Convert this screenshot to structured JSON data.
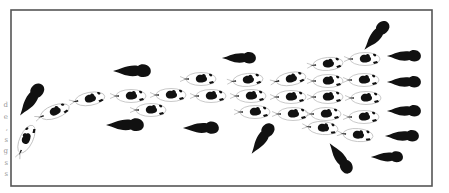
{
  "figure": {
    "frame": {
      "x": 11,
      "y": 10,
      "width": 421,
      "height": 176,
      "stroke": "#555555"
    },
    "colors": {
      "predator": "#111111",
      "school_outline": "#bbbbbb",
      "school_spot": "#111111",
      "background": "#ffffff"
    },
    "margin_text_fragments": [
      "d",
      "e",
      ",",
      "s",
      "g",
      "s",
      "s"
    ],
    "predators": [
      {
        "x": 31,
        "y": 100,
        "angle": -55,
        "scale": 1.0
      },
      {
        "x": 132,
        "y": 71,
        "angle": 0,
        "scale": 1.0
      },
      {
        "x": 125,
        "y": 125,
        "angle": 0,
        "scale": 1.0
      },
      {
        "x": 201,
        "y": 128,
        "angle": 0,
        "scale": 0.95
      },
      {
        "x": 239,
        "y": 58,
        "angle": 0,
        "scale": 0.9
      },
      {
        "x": 376,
        "y": 36,
        "angle": -50,
        "scale": 0.95
      },
      {
        "x": 404,
        "y": 56,
        "angle": 0,
        "scale": 0.9
      },
      {
        "x": 404,
        "y": 82,
        "angle": 0,
        "scale": 0.9
      },
      {
        "x": 404,
        "y": 111,
        "angle": 0,
        "scale": 0.9
      },
      {
        "x": 402,
        "y": 136,
        "angle": 0,
        "scale": 0.9
      },
      {
        "x": 387,
        "y": 157,
        "angle": 0,
        "scale": 0.85
      },
      {
        "x": 262,
        "y": 139,
        "angle": -55,
        "scale": 0.95
      },
      {
        "x": 340,
        "y": 158,
        "angle": 55,
        "scale": 0.95
      }
    ],
    "school": [
      {
        "x": 26,
        "y": 140,
        "angle": -65
      },
      {
        "x": 54,
        "y": 112,
        "angle": -20
      },
      {
        "x": 89,
        "y": 99,
        "angle": -10
      },
      {
        "x": 130,
        "y": 96,
        "angle": 0
      },
      {
        "x": 170,
        "y": 95,
        "angle": 0
      },
      {
        "x": 150,
        "y": 110,
        "angle": 0
      },
      {
        "x": 200,
        "y": 79,
        "angle": 0
      },
      {
        "x": 210,
        "y": 96,
        "angle": 0
      },
      {
        "x": 247,
        "y": 80,
        "angle": -5
      },
      {
        "x": 250,
        "y": 96,
        "angle": 0
      },
      {
        "x": 254,
        "y": 112,
        "angle": 0
      },
      {
        "x": 290,
        "y": 79,
        "angle": -10
      },
      {
        "x": 290,
        "y": 97,
        "angle": 0
      },
      {
        "x": 292,
        "y": 114,
        "angle": 0
      },
      {
        "x": 327,
        "y": 64,
        "angle": -5
      },
      {
        "x": 327,
        "y": 81,
        "angle": 0
      },
      {
        "x": 327,
        "y": 97,
        "angle": 0
      },
      {
        "x": 325,
        "y": 114,
        "angle": 0
      },
      {
        "x": 322,
        "y": 128,
        "angle": 5
      },
      {
        "x": 364,
        "y": 59,
        "angle": 0
      },
      {
        "x": 363,
        "y": 80,
        "angle": 0
      },
      {
        "x": 365,
        "y": 98,
        "angle": 0
      },
      {
        "x": 363,
        "y": 117,
        "angle": 0
      },
      {
        "x": 357,
        "y": 135,
        "angle": 5
      }
    ]
  }
}
